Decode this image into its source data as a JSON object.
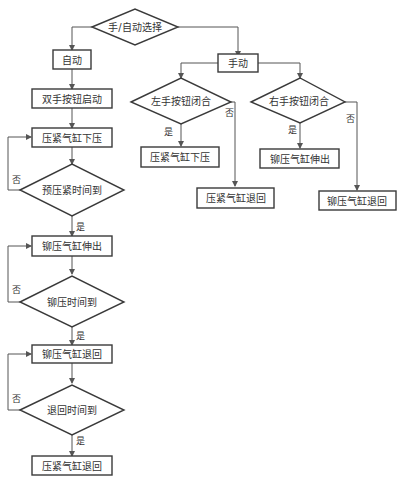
{
  "diagram": {
    "type": "flowchart",
    "nodes": {
      "mode_select": "手/自动选择",
      "auto": "自动",
      "manual": "手动",
      "two_hand_start": "双手按钮启动",
      "clamp_down_auto": "压紧气缸下压",
      "preclamp_time": "预压紧时间到",
      "rivet_extend_auto": "铆压气缸伸出",
      "rivet_time": "铆压时间到",
      "rivet_retract_auto": "铆压气缸退回",
      "retract_time": "退回时间到",
      "clamp_retract_auto": "压紧气缸退回",
      "left_button": "左手按钮闭合",
      "right_button": "右手按钮闭合",
      "clamp_down_manual": "压紧气缸下压",
      "clamp_retract_manual": "压紧气缸退回",
      "rivet_extend_manual": "铆压气缸伸出",
      "rivet_retract_manual": "铆压气缸退回"
    },
    "labels": {
      "yes": "是",
      "no": "否"
    },
    "edges": [
      {
        "from": "mode_select",
        "to": "auto"
      },
      {
        "from": "mode_select",
        "to": "manual"
      },
      {
        "from": "auto",
        "to": "two_hand_start"
      },
      {
        "from": "two_hand_start",
        "to": "clamp_down_auto"
      },
      {
        "from": "clamp_down_auto",
        "to": "preclamp_time"
      },
      {
        "from": "preclamp_time",
        "to": "rivet_extend_auto",
        "label": "是"
      },
      {
        "from": "preclamp_time",
        "to": "clamp_down_auto",
        "label": "否"
      },
      {
        "from": "rivet_extend_auto",
        "to": "rivet_time"
      },
      {
        "from": "rivet_time",
        "to": "rivet_retract_auto",
        "label": "是"
      },
      {
        "from": "rivet_time",
        "to": "rivet_extend_auto",
        "label": "否"
      },
      {
        "from": "rivet_retract_auto",
        "to": "retract_time"
      },
      {
        "from": "retract_time",
        "to": "clamp_retract_auto",
        "label": "是"
      },
      {
        "from": "retract_time",
        "to": "rivet_retract_auto",
        "label": "否"
      },
      {
        "from": "manual",
        "to": "left_button"
      },
      {
        "from": "manual",
        "to": "right_button"
      },
      {
        "from": "left_button",
        "to": "clamp_down_manual",
        "label": "是"
      },
      {
        "from": "left_button",
        "to": "clamp_retract_manual",
        "label": "否"
      },
      {
        "from": "right_button",
        "to": "rivet_extend_manual",
        "label": "是"
      },
      {
        "from": "right_button",
        "to": "rivet_retract_manual",
        "label": "否"
      }
    ]
  }
}
